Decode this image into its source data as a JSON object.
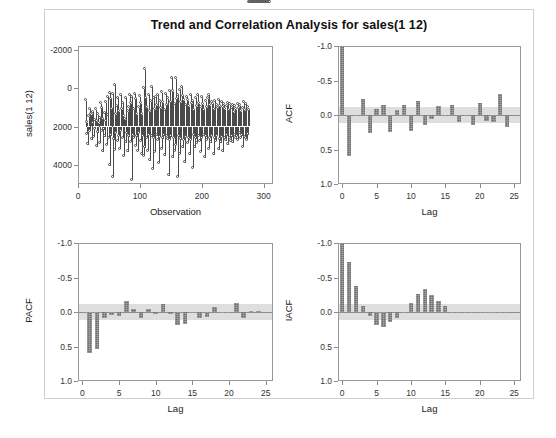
{
  "figure": {
    "title": "Trend and Correlation Analysis for sales(1 12)"
  },
  "panels": {
    "series": {
      "ylabel": "sales(1 12)",
      "xlabel": "Observation",
      "yticks": [
        "4000",
        "2000",
        "0",
        "-2000"
      ],
      "xticks": [
        "0",
        "100",
        "200",
        "300"
      ]
    },
    "acf": {
      "ylabel": "ACF",
      "xlabel": "Lag",
      "yticks": [
        "1.0",
        "0.5",
        "0.0",
        "-0.5",
        "-1.0"
      ],
      "xticks": [
        "0",
        "5",
        "10",
        "15",
        "20",
        "25"
      ]
    },
    "pacf": {
      "ylabel": "PACF",
      "xlabel": "Lag",
      "yticks": [
        "1.0",
        "0.5",
        "0.0",
        "-0.5",
        "-1.0"
      ],
      "xticks": [
        "0",
        "5",
        "10",
        "15",
        "20",
        "25"
      ]
    },
    "iacf": {
      "ylabel": "IACF",
      "xlabel": "Lag",
      "yticks": [
        "1.0",
        "0.5",
        "0.0",
        "-0.5",
        "-1.0"
      ],
      "xticks": [
        "0",
        "5",
        "10",
        "15",
        "20",
        "25"
      ]
    }
  },
  "colors": {
    "bar": "#6e6e6e",
    "band": "#d8d8d8",
    "axis": "#9a9a9a",
    "needle": "#4a4a4a",
    "text": "#1a1a1a"
  },
  "chart_data": [
    {
      "type": "line",
      "panel": "series",
      "title": "Trend and Correlation Analysis for sales(1 12)",
      "xlabel": "Observation",
      "ylabel": "sales(1 12)",
      "xlim": [
        0,
        315
      ],
      "ylim": [
        -3000,
        4200
      ],
      "xticks": [
        0,
        100,
        200,
        300
      ],
      "yticks": [
        -2000,
        0,
        2000,
        4000
      ],
      "grid": false,
      "marker": "circle",
      "style": "needle-with-markers",
      "note": "Differenced sales series (1 12), approximately 300 observations of mean-zero noise with spikes to about +3900 and -2800",
      "x": [
        13,
        14,
        15,
        16,
        17,
        18,
        19,
        20,
        21,
        22,
        23,
        24,
        25,
        26,
        27,
        28,
        29,
        30,
        31,
        32,
        33,
        34,
        35,
        36,
        37,
        38,
        39,
        40,
        41,
        42,
        43,
        44,
        45,
        46,
        47,
        48,
        49,
        50,
        51,
        52,
        53,
        54,
        55,
        56,
        57,
        58,
        59,
        60,
        61,
        62,
        63,
        64,
        65,
        66,
        67,
        68,
        69,
        70,
        71,
        72,
        73,
        74,
        75,
        76,
        77,
        78,
        79,
        80,
        81,
        82,
        83,
        84,
        85,
        86,
        87,
        88,
        89,
        90,
        91,
        92,
        93,
        94,
        95,
        96,
        97,
        98,
        99,
        100,
        101,
        102,
        103,
        104,
        105,
        106,
        107,
        108,
        109,
        110,
        111,
        112,
        113,
        114,
        115,
        116,
        117,
        118,
        119,
        120,
        121,
        122,
        123,
        124,
        125,
        126,
        127,
        128,
        129,
        130,
        131,
        132,
        133,
        134,
        135,
        136,
        137,
        138,
        139,
        140,
        141,
        142,
        143,
        144,
        145,
        146,
        147,
        148,
        149,
        150,
        151,
        152,
        153,
        154,
        155,
        156,
        157,
        158,
        159,
        160,
        161,
        162,
        163,
        164,
        165,
        166,
        167,
        168,
        169,
        170,
        171,
        172,
        173,
        174,
        175,
        176,
        177,
        178,
        179,
        180,
        181,
        182,
        183,
        184,
        185,
        186,
        187,
        188,
        189,
        190,
        191,
        192,
        193,
        194,
        195,
        196,
        197,
        198,
        199,
        200,
        201,
        202,
        203,
        204,
        205,
        206,
        207,
        208,
        209,
        210,
        211,
        212,
        213,
        214,
        215,
        216,
        217,
        218,
        219,
        220,
        221,
        222,
        223,
        224,
        225,
        226,
        227,
        228,
        229,
        230,
        231,
        232,
        233,
        234,
        235,
        236,
        237,
        238,
        239,
        240,
        241,
        242,
        243,
        244,
        245,
        246,
        247,
        248,
        249,
        250,
        251,
        252,
        253,
        254,
        255,
        256,
        257,
        258,
        259,
        260,
        261,
        262,
        263,
        264,
        265,
        266,
        267,
        268,
        269,
        270,
        271,
        272,
        273,
        274,
        275,
        276,
        277,
        278,
        279,
        280,
        281,
        282,
        283,
        284,
        285,
        286,
        287,
        288,
        289,
        290,
        291,
        292,
        293,
        294,
        295,
        296,
        297,
        298,
        299,
        300,
        301,
        302,
        303,
        304,
        305,
        306,
        307,
        308,
        309,
        310
      ],
      "y": [
        1350,
        -400,
        200,
        -950,
        -300,
        520,
        900,
        -260,
        640,
        600,
        -700,
        180,
        740,
        -560,
        320,
        -140,
        880,
        -1050,
        260,
        -320,
        620,
        150,
        -880,
        420,
        1180,
        -260,
        960,
        -1320,
        380,
        -160,
        700,
        -540,
        1250,
        240,
        -980,
        560,
        1520,
        -620,
        1740,
        -2050,
        1420,
        -480,
        900,
        -2650,
        1680,
        -700,
        2150,
        -1230,
        620,
        -340,
        1060,
        -760,
        1480,
        -520,
        760,
        -1180,
        1640,
        -260,
        880,
        -620,
        1220,
        -1560,
        520,
        340,
        -860,
        1480,
        -380,
        760,
        -1320,
        980,
        -540,
        1620,
        -820,
        1180,
        -2800,
        1520,
        -460,
        880,
        -620,
        1680,
        -1020,
        1420,
        -540,
        620,
        -1280,
        980,
        -360,
        1540,
        -760,
        1180,
        -1480,
        620,
        -520,
        1960,
        -1560,
        2960,
        -1120,
        1480,
        -620,
        980,
        -1280,
        1620,
        -460,
        760,
        -1780,
        1280,
        -540,
        2060,
        -2220,
        1480,
        -620,
        880,
        -1340,
        1520,
        -480,
        1080,
        -720,
        1640,
        -1920,
        1280,
        -560,
        920,
        -1180,
        1760,
        -640,
        1240,
        -480,
        860,
        -1520,
        1680,
        -520,
        1120,
        -680,
        1440,
        -2560,
        1840,
        -720,
        1260,
        -540,
        2520,
        -1640,
        1820,
        -620,
        1160,
        -1280,
        2480,
        -980,
        1420,
        -2660,
        1620,
        -540,
        1880,
        -1460,
        1240,
        -680,
        2060,
        -1120,
        1580,
        -720,
        1340,
        -1880,
        1120,
        -560,
        1520,
        -880,
        1340,
        -620,
        1020,
        -1480,
        1640,
        -720,
        1180,
        -2180,
        1320,
        -480,
        860,
        -1120,
        1480,
        -640,
        1020,
        -880,
        1620,
        -520,
        1180,
        -760,
        980,
        -1340,
        1520,
        -620,
        1140,
        -480,
        860,
        -1620,
        1280,
        -540,
        980,
        -720,
        1440,
        -1180,
        1620,
        -620,
        1080,
        -860,
        1240,
        -520,
        1160,
        -1480,
        880,
        -640,
        1320,
        -780,
        1080,
        -520,
        940,
        -1220,
        1380,
        -680,
        1020,
        -840,
        1260,
        -560,
        980,
        -1320,
        1140,
        -620,
        880,
        -740,
        1060,
        -480,
        1220,
        -960,
        840,
        -620,
        1140,
        -780,
        960,
        -540,
        1080,
        -860,
        720,
        -480,
        1020,
        -640,
        880,
        -520,
        1160,
        -720,
        940,
        -380,
        1080,
        -620,
        760,
        -480,
        920,
        -1080,
        1240,
        -560,
        820,
        -640,
        1160,
        -720,
        980,
        -420,
        860
      ]
    },
    {
      "type": "bar",
      "panel": "acf",
      "title": "ACF",
      "xlabel": "Lag",
      "ylabel": "ACF",
      "xlim": [
        -0.6,
        26
      ],
      "ylim": [
        -1.0,
        1.0
      ],
      "xticks": [
        0,
        5,
        10,
        15,
        20,
        25
      ],
      "yticks": [
        -1.0,
        -0.5,
        0.0,
        0.5,
        1.0
      ],
      "grid": false,
      "confidence_band": 0.113,
      "lags": [
        0,
        1,
        2,
        3,
        4,
        5,
        6,
        7,
        8,
        9,
        10,
        11,
        12,
        13,
        14,
        15,
        16,
        17,
        18,
        19,
        20,
        21,
        22,
        23,
        24
      ],
      "values": [
        1.0,
        -0.6,
        -0.02,
        0.23,
        -0.26,
        0.08,
        0.15,
        -0.24,
        0.07,
        0.15,
        -0.23,
        0.21,
        -0.15,
        -0.06,
        0.13,
        -0.02,
        0.15,
        -0.1,
        -0.01,
        -0.14,
        0.17,
        -0.09,
        -0.1,
        0.31,
        -0.17
      ]
    },
    {
      "type": "bar",
      "panel": "pacf",
      "title": "PACF",
      "xlabel": "Lag",
      "ylabel": "PACF",
      "xlim": [
        -0.6,
        26
      ],
      "ylim": [
        -1.0,
        1.0
      ],
      "xticks": [
        0,
        5,
        10,
        15,
        20,
        25
      ],
      "yticks": [
        -1.0,
        -0.5,
        0.0,
        0.5,
        1.0
      ],
      "grid": false,
      "confidence_band": 0.113,
      "lags": [
        1,
        2,
        3,
        4,
        5,
        6,
        7,
        8,
        9,
        10,
        11,
        12,
        13,
        14,
        15,
        16,
        17,
        18,
        19,
        20,
        21,
        22,
        23,
        24
      ],
      "values": [
        -0.59,
        -0.53,
        -0.09,
        -0.05,
        -0.06,
        0.16,
        0.04,
        -0.09,
        0.05,
        -0.03,
        0.11,
        -0.03,
        -0.19,
        -0.18,
        -0.01,
        -0.09,
        -0.07,
        0.07,
        -0.02,
        -0.02,
        0.13,
        -0.09,
        0.01,
        0.01
      ]
    },
    {
      "type": "bar",
      "panel": "iacf",
      "title": "IACF",
      "xlabel": "Lag",
      "ylabel": "IACF",
      "xlim": [
        -0.6,
        26
      ],
      "ylim": [
        -1.0,
        1.0
      ],
      "xticks": [
        0,
        5,
        10,
        15,
        20,
        25
      ],
      "yticks": [
        -1.0,
        -0.5,
        0.0,
        0.5,
        1.0
      ],
      "grid": false,
      "confidence_band": 0.113,
      "lags": [
        0,
        1,
        2,
        3,
        4,
        5,
        6,
        7,
        8,
        9,
        10,
        11,
        12,
        13,
        14,
        15,
        16,
        17,
        18,
        19,
        20,
        21,
        22,
        23,
        24
      ],
      "values": [
        1.0,
        0.72,
        0.37,
        0.09,
        -0.06,
        -0.19,
        -0.22,
        -0.15,
        -0.09,
        -0.02,
        0.13,
        0.26,
        0.33,
        0.25,
        0.16,
        0.08,
        -0.01,
        -0.02,
        -0.02,
        -0.01,
        -0.01,
        -0.01,
        -0.01,
        -0.02,
        0.0
      ]
    }
  ]
}
